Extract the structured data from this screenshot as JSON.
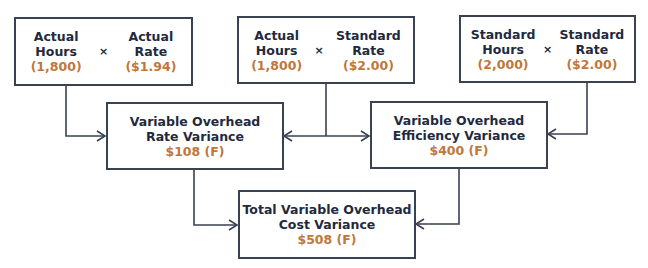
{
  "formulas": [
    {
      "left": {
        "label_line1": "Actual",
        "label_line2": "Hours",
        "value": "(1,800)"
      },
      "operator": "×",
      "right": {
        "label_line1": "Actual",
        "label_line2": "Rate",
        "value": "($1.94)"
      }
    },
    {
      "left": {
        "label_line1": "Actual",
        "label_line2": "Hours",
        "value": "(1,800)"
      },
      "operator": "×",
      "right": {
        "label_line1": "Standard",
        "label_line2": "Rate",
        "value": "($2.00)"
      }
    },
    {
      "left": {
        "label_line1": "Standard",
        "label_line2": "Hours",
        "value": "(2,000)"
      },
      "operator": "×",
      "right": {
        "label_line1": "Standard",
        "label_line2": "Rate",
        "value": "($2.00)"
      }
    }
  ],
  "variances": {
    "rate": {
      "title_line1": "Variable Overhead",
      "title_line2": "Rate Variance",
      "value": "$108 (F)"
    },
    "efficiency": {
      "title_line1": "Variable Overhead",
      "title_line2": "Efficiency Variance",
      "value": "$400 (F)"
    },
    "total": {
      "title_line1": "Total Variable Overhead",
      "title_line2": "Cost Variance",
      "value": "$508 (F)"
    }
  },
  "colors": {
    "text": "#1f2a3d",
    "value": "#c0773a",
    "line": "#3a4150"
  }
}
